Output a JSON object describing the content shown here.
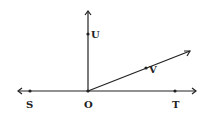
{
  "diagram": {
    "type": "geometry-rays",
    "stroke_color": "#222222",
    "points": {
      "O": {
        "label": "O"
      },
      "S": {
        "label": "S"
      },
      "T": {
        "label": "T"
      },
      "U": {
        "label": "U"
      },
      "V": {
        "label": "V"
      }
    }
  }
}
